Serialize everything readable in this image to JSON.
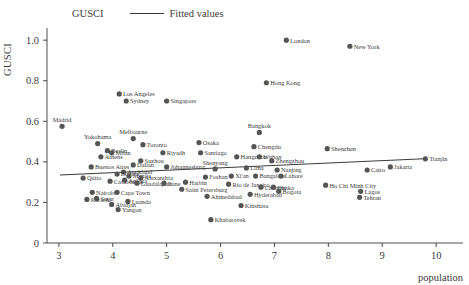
{
  "legend": {
    "marker_label": "GUSCI",
    "line_label": "Fitted values",
    "marker_icon": "filled-circle-marker",
    "line_icon": "line-segment"
  },
  "axes": {
    "y_title": "GUSCI",
    "x_title": "population",
    "y_ticks": [
      "0",
      "0.2",
      "0.4",
      "0.6",
      "0.8",
      "1.0"
    ],
    "x_ticks": [
      "3",
      "4",
      "5",
      "6",
      "7",
      "8",
      "9",
      "10"
    ]
  },
  "colors": {
    "marker": "#555555",
    "axis": "#3a3a3a",
    "fit_line": "#3a3a3a",
    "background": "#ffffff"
  },
  "chart_data": {
    "type": "scatter",
    "title": "",
    "xlabel": "population",
    "ylabel": "GUSCI",
    "xlim": [
      2.78,
      10.35
    ],
    "ylim": [
      0,
      1.06
    ],
    "grid": false,
    "legend_position": "top-center",
    "series": [
      {
        "name": "GUSCI",
        "marker": "circle",
        "points": [
          {
            "label": "London",
            "x": 7.22,
            "y": 1.0,
            "lp": "right"
          },
          {
            "label": "New York",
            "x": 8.4,
            "y": 0.97,
            "lp": "right"
          },
          {
            "label": "Hong Kong",
            "x": 6.85,
            "y": 0.79,
            "lp": "right"
          },
          {
            "label": "Los Angeles",
            "x": 4.12,
            "y": 0.735,
            "lp": "right"
          },
          {
            "label": "Sydney",
            "x": 4.25,
            "y": 0.7,
            "lp": "right"
          },
          {
            "label": "Singapore",
            "x": 5.0,
            "y": 0.7,
            "lp": "right"
          },
          {
            "label": "Madrid",
            "x": 3.06,
            "y": 0.575,
            "lp": "above"
          },
          {
            "label": "Bangkok",
            "x": 6.72,
            "y": 0.545,
            "lp": "above"
          },
          {
            "label": "Melbourne",
            "x": 4.38,
            "y": 0.515,
            "lp": "above"
          },
          {
            "label": "Yokohama",
            "x": 3.72,
            "y": 0.49,
            "lp": "above"
          },
          {
            "label": "Toronto",
            "x": 4.56,
            "y": 0.485,
            "lp": "right"
          },
          {
            "label": "Osaka",
            "x": 5.6,
            "y": 0.495,
            "lp": "right"
          },
          {
            "label": "Chengdu",
            "x": 6.62,
            "y": 0.475,
            "lp": "right"
          },
          {
            "label": "Shenzhen",
            "x": 7.98,
            "y": 0.465,
            "lp": "right"
          },
          {
            "label": "Berlin",
            "x": 3.9,
            "y": 0.455,
            "lp": "right"
          },
          {
            "label": "Riyadh",
            "x": 4.93,
            "y": 0.445,
            "lp": "right"
          },
          {
            "label": "Santiago",
            "x": 5.63,
            "y": 0.445,
            "lp": "right"
          },
          {
            "label": "Milan",
            "x": 3.98,
            "y": 0.445,
            "lp": "right"
          },
          {
            "label": "Athens",
            "x": 3.78,
            "y": 0.425,
            "lp": "right"
          },
          {
            "label": "Hangzhou",
            "x": 6.3,
            "y": 0.425,
            "lp": "right"
          },
          {
            "label": "Wuhan",
            "x": 6.72,
            "y": 0.425,
            "lp": "right"
          },
          {
            "label": "Suzhou",
            "x": 4.52,
            "y": 0.405,
            "lp": "right"
          },
          {
            "label": "Zhengzhou",
            "x": 6.95,
            "y": 0.405,
            "lp": "right"
          },
          {
            "label": "Tianjin",
            "x": 9.8,
            "y": 0.415,
            "lp": "right"
          },
          {
            "label": "Dalian",
            "x": 4.38,
            "y": 0.385,
            "lp": "right"
          },
          {
            "label": "Buenos Aires",
            "x": 3.6,
            "y": 0.375,
            "lp": "right"
          },
          {
            "label": "Johannesburg",
            "x": 5.0,
            "y": 0.375,
            "lp": "right"
          },
          {
            "label": "Jakarta",
            "x": 9.15,
            "y": 0.375,
            "lp": "right"
          },
          {
            "label": "Shenyang",
            "x": 5.9,
            "y": 0.365,
            "lp": "above"
          },
          {
            "label": "Lima",
            "x": 6.48,
            "y": 0.37,
            "lp": "right"
          },
          {
            "label": "Nanjing",
            "x": 7.05,
            "y": 0.36,
            "lp": "right"
          },
          {
            "label": "Cairo",
            "x": 8.72,
            "y": 0.36,
            "lp": "right"
          },
          {
            "label": "Auckland",
            "x": 4.2,
            "y": 0.35,
            "lp": "right"
          },
          {
            "label": "Bogota",
            "x": 4.08,
            "y": 0.34,
            "lp": "right"
          },
          {
            "label": "Manila",
            "x": 4.3,
            "y": 0.33,
            "lp": "right"
          },
          {
            "label": "Xi'an",
            "x": 6.2,
            "y": 0.33,
            "lp": "right"
          },
          {
            "label": "Bangalore",
            "x": 6.65,
            "y": 0.33,
            "lp": "right"
          },
          {
            "label": "Lahore",
            "x": 7.12,
            "y": 0.33,
            "lp": "right"
          },
          {
            "label": "Foshan",
            "x": 5.72,
            "y": 0.325,
            "lp": "right"
          },
          {
            "label": "Quito",
            "x": 3.45,
            "y": 0.32,
            "lp": "right"
          },
          {
            "label": "Ankara",
            "x": 4.22,
            "y": 0.31,
            "lp": "right"
          },
          {
            "label": "Alexandria",
            "x": 4.52,
            "y": 0.32,
            "lp": "right"
          },
          {
            "label": "Casablanca",
            "x": 3.95,
            "y": 0.305,
            "lp": "right"
          },
          {
            "label": "Guadalajara",
            "x": 4.45,
            "y": 0.295,
            "lp": "right"
          },
          {
            "label": "Pune",
            "x": 4.95,
            "y": 0.295,
            "lp": "right"
          },
          {
            "label": "Harbin",
            "x": 5.35,
            "y": 0.3,
            "lp": "right"
          },
          {
            "label": "Rio de Janeiro",
            "x": 6.15,
            "y": 0.29,
            "lp": "right"
          },
          {
            "label": "Ho Chi Minh City",
            "x": 7.95,
            "y": 0.285,
            "lp": "right"
          },
          {
            "label": "Chennai",
            "x": 6.75,
            "y": 0.275,
            "lp": "right"
          },
          {
            "label": "Dhaka",
            "x": 6.98,
            "y": 0.275,
            "lp": "right"
          },
          {
            "label": "Saint Petersburg",
            "x": 5.28,
            "y": 0.265,
            "lp": "right"
          },
          {
            "label": "Lagos",
            "x": 8.6,
            "y": 0.255,
            "lp": "right"
          },
          {
            "label": "Bogota2",
            "x": 7.08,
            "y": 0.255,
            "lp": "right"
          },
          {
            "label": "Cape Town",
            "x": 4.08,
            "y": 0.25,
            "lp": "right"
          },
          {
            "label": "Nairobi",
            "x": 3.62,
            "y": 0.25,
            "lp": "right"
          },
          {
            "label": "Hyderabad",
            "x": 6.55,
            "y": 0.24,
            "lp": "right"
          },
          {
            "label": "Ahmedabad",
            "x": 5.75,
            "y": 0.23,
            "lp": "right"
          },
          {
            "label": "Tehran",
            "x": 8.58,
            "y": 0.225,
            "lp": "right"
          },
          {
            "label": "Surat",
            "x": 3.7,
            "y": 0.22,
            "lp": "right"
          },
          {
            "label": "Karachi",
            "x": 3.52,
            "y": 0.215,
            "lp": "right"
          },
          {
            "label": "Luanda",
            "x": 4.28,
            "y": 0.205,
            "lp": "right"
          },
          {
            "label": "Abidjan",
            "x": 3.98,
            "y": 0.19,
            "lp": "right"
          },
          {
            "label": "Kinshasa",
            "x": 6.38,
            "y": 0.185,
            "lp": "right"
          },
          {
            "label": "Yangon",
            "x": 4.1,
            "y": 0.165,
            "lp": "right"
          },
          {
            "label": "Khabarovsk",
            "x": 5.82,
            "y": 0.115,
            "lp": "right"
          }
        ]
      }
    ],
    "fit_line": {
      "name": "Fitted values",
      "x_start": 3.02,
      "y_start": 0.335,
      "x_end": 9.78,
      "y_end": 0.415
    }
  }
}
